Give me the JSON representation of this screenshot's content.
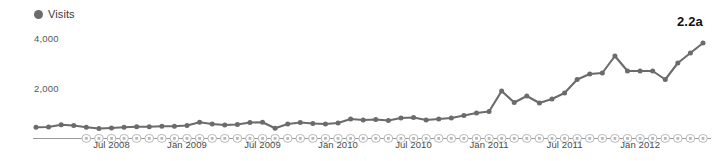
{
  "figure": {
    "tag": "2.2a"
  },
  "legend": {
    "series_label": "Visits",
    "marker_icon": "filled-circle-icon",
    "color": "#6b6b6b",
    "position": "top-left"
  },
  "axes": {
    "y_ticks": [
      "2,000",
      "4,000"
    ],
    "y_tick_top": "4,000",
    "y_tick_mid": "2,000",
    "x_ticks": [
      "Jul 2008",
      "Jan 2009",
      "Jul 2009",
      "Jan 2010",
      "Jul 2010",
      "Jan 2011",
      "Jul 2011",
      "Jan 2012"
    ]
  },
  "colors": {
    "line": "#6b6b6b",
    "marker": "#6b6b6b",
    "axis": "#9a9a9a",
    "annotation_marker": "#b8b8b8",
    "text": "#4a4a4a",
    "background": "#ffffff"
  },
  "chart_data": {
    "type": "line",
    "title": "",
    "subtitle": "",
    "xlabel": "",
    "ylabel": "Visits",
    "ylim": [
      0,
      4400
    ],
    "grid": false,
    "legend_position": "top-left",
    "annotation": "2.2a",
    "y_tick_values": [
      2000,
      4000
    ],
    "x_tick_labels": [
      "Jul 2008",
      "Jan 2009",
      "Jul 2009",
      "Jan 2010",
      "Jul 2010",
      "Jan 2011",
      "Jul 2011",
      "Jan 2012"
    ],
    "x_tick_indices": [
      6,
      12,
      18,
      24,
      30,
      36,
      42,
      48
    ],
    "series": [
      {
        "name": "Visits",
        "color": "#6b6b6b",
        "x": [
          "Jan 2008",
          "Feb 2008",
          "Mar 2008",
          "Apr 2008",
          "May 2008",
          "Jun 2008",
          "Jul 2008",
          "Aug 2008",
          "Sep 2008",
          "Oct 2008",
          "Nov 2008",
          "Dec 2008",
          "Jan 2009",
          "Feb 2009",
          "Mar 2009",
          "Apr 2009",
          "May 2009",
          "Jun 2009",
          "Jul 2009",
          "Aug 2009",
          "Sep 2009",
          "Oct 2009",
          "Nov 2009",
          "Dec 2009",
          "Jan 2010",
          "Feb 2010",
          "Mar 2010",
          "Apr 2010",
          "May 2010",
          "Jun 2010",
          "Jul 2010",
          "Aug 2010",
          "Sep 2010",
          "Oct 2010",
          "Nov 2010",
          "Dec 2010",
          "Jan 2011",
          "Feb 2011",
          "Mar 2011",
          "Apr 2011",
          "May 2011",
          "Jun 2011",
          "Jul 2011",
          "Aug 2011",
          "Sep 2011",
          "Oct 2011",
          "Nov 2011",
          "Dec 2011",
          "Jan 2012",
          "Feb 2012",
          "Mar 2012",
          "Apr 2012",
          "May 2012",
          "Jun 2012"
        ],
        "values": [
          430,
          440,
          530,
          500,
          430,
          380,
          400,
          430,
          450,
          450,
          470,
          470,
          500,
          630,
          560,
          520,
          540,
          620,
          630,
          390,
          560,
          620,
          580,
          560,
          600,
          760,
          720,
          740,
          700,
          800,
          820,
          720,
          760,
          800,
          900,
          1000,
          1060,
          1880,
          1420,
          1680,
          1400,
          1560,
          1800,
          2340,
          2560,
          2600,
          3280,
          2680,
          2680,
          2680,
          2340,
          3000,
          3400,
          3800
        ]
      }
    ]
  }
}
